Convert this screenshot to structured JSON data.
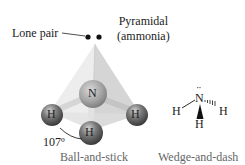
{
  "title": {
    "line1": "Pyramidal",
    "line2": "(ammonia)"
  },
  "lone_pair_label": "Lone pair",
  "angle_label": "107º",
  "ball_and_stick": {
    "caption": "Ball-and-stick",
    "central_atom": "N",
    "atoms": [
      "H",
      "H",
      "H"
    ]
  },
  "wedge_and_dash": {
    "caption": "Wedge-and-dash",
    "central_atom": "N",
    "lone_pair_dots": "··",
    "atoms": [
      "H",
      "H",
      "H"
    ]
  },
  "colors": {
    "tetra_light": "#e8e8e8",
    "tetra_mid": "#d4d4d4",
    "tetra_dark": "#c2c2c2",
    "nitrogen": "#a0a0a0",
    "hydrogen": "#555555",
    "bond": "#cfcfcf"
  }
}
